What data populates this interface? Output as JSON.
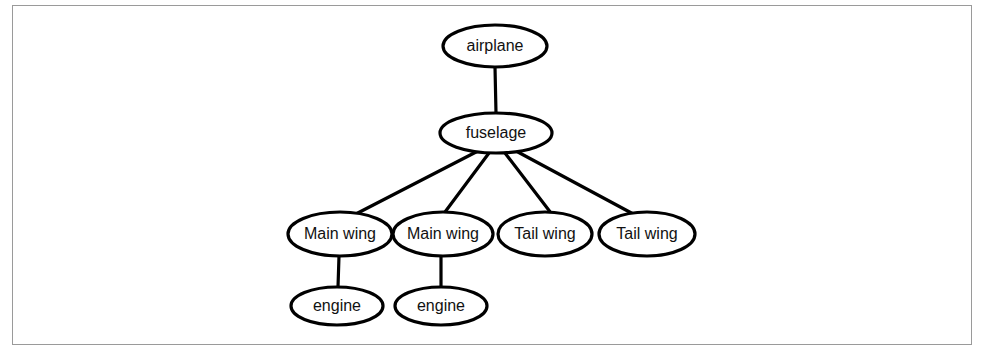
{
  "figure": {
    "background_color": "#ffffff",
    "border_color": "#9a9a9a",
    "node_fill": "#ffffff",
    "node_stroke": "#000000",
    "edge_color": "#000000"
  },
  "chart_data": {
    "type": "diagram",
    "diagram_kind": "tree",
    "orientation": "top-down",
    "nodes": [
      {
        "id": "airplane",
        "label": "airplane",
        "level": 0,
        "cx": 495,
        "cy": 46,
        "rx": 52,
        "ry": 21
      },
      {
        "id": "fuselage",
        "label": "fuselage",
        "level": 1,
        "cx": 496,
        "cy": 133,
        "rx": 56,
        "ry": 20
      },
      {
        "id": "mainwing1",
        "label": "Main wing",
        "level": 2,
        "cx": 340,
        "cy": 234,
        "rx": 52,
        "ry": 22
      },
      {
        "id": "mainwing2",
        "label": "Main wing",
        "level": 2,
        "cx": 443,
        "cy": 234,
        "rx": 50,
        "ry": 22
      },
      {
        "id": "tailwing1",
        "label": "Tail wing",
        "level": 2,
        "cx": 545,
        "cy": 234,
        "rx": 47,
        "ry": 22
      },
      {
        "id": "tailwing2",
        "label": "Tail wing",
        "level": 2,
        "cx": 647,
        "cy": 234,
        "rx": 48,
        "ry": 22
      },
      {
        "id": "engine1",
        "label": "engine",
        "level": 3,
        "cx": 337,
        "cy": 306,
        "rx": 46,
        "ry": 19
      },
      {
        "id": "engine2",
        "label": "engine",
        "level": 3,
        "cx": 441,
        "cy": 306,
        "rx": 46,
        "ry": 19
      }
    ],
    "edges": [
      {
        "from": "airplane",
        "to": "fuselage",
        "x1": 495,
        "y1": 67,
        "x2": 496,
        "y2": 113
      },
      {
        "from": "fuselage",
        "to": "mainwing1",
        "x1": 478,
        "y1": 151,
        "x2": 350,
        "y2": 217
      },
      {
        "from": "fuselage",
        "to": "mainwing2",
        "x1": 489,
        "y1": 153,
        "x2": 445,
        "y2": 212
      },
      {
        "from": "fuselage",
        "to": "tailwing1",
        "x1": 505,
        "y1": 153,
        "x2": 551,
        "y2": 213
      },
      {
        "from": "fuselage",
        "to": "tailwing2",
        "x1": 516,
        "y1": 151,
        "x2": 637,
        "y2": 216
      },
      {
        "from": "mainwing1",
        "to": "engine1",
        "x1": 339,
        "y1": 256,
        "x2": 338,
        "y2": 287
      },
      {
        "from": "mainwing2",
        "to": "engine2",
        "x1": 441,
        "y1": 256,
        "x2": 441,
        "y2": 287
      }
    ]
  }
}
